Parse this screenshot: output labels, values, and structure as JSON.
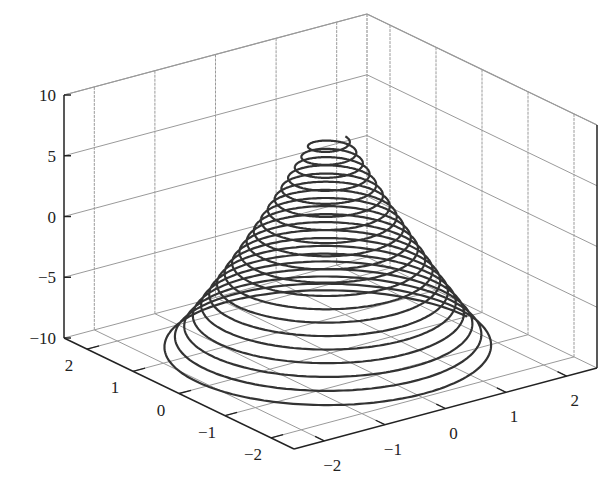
{
  "chart_data": {
    "type": "line3d",
    "title": "",
    "xlabel": "",
    "ylabel": "",
    "zlabel": "",
    "x_ticks": [
      "−2",
      "−1",
      "0",
      "1",
      "2"
    ],
    "y_ticks": [
      "−2",
      "−1",
      "0",
      "1",
      "2"
    ],
    "z_ticks": [
      "−10",
      "−5",
      "0",
      "5",
      "10"
    ],
    "xlim": [
      -2.5,
      2.5
    ],
    "ylim": [
      -2.5,
      2.5
    ],
    "zlim": [
      -10,
      10
    ],
    "grid": true,
    "series": [
      {
        "name": "helix",
        "parametric": "x = r(t)cos(t), y = r(t)sin(t), z = t-dependent",
        "z_start": -10,
        "z_end": 7.5,
        "r_start": 2.3,
        "r_end": 0.25,
        "turns": 20,
        "color": "#333333"
      }
    ]
  },
  "colors": {
    "grid": "#9a9a9a",
    "axis": "#222222",
    "curve": "#333333"
  }
}
